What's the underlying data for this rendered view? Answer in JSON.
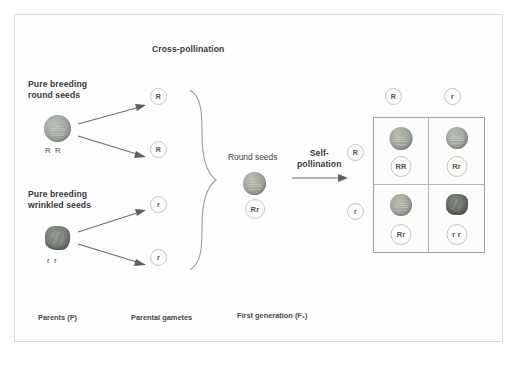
{
  "figure": {
    "title_top": "Cross-pollination",
    "self_pollination": "Self-\npollination"
  },
  "parents": {
    "round": {
      "heading": "Pure breeding\nround seeds",
      "genotype": "R R",
      "seed_type": "round-seed"
    },
    "wrinkled": {
      "heading": "Pure breeding\nwrinkled seeds",
      "genotype": "r r",
      "seed_type": "wrinkled-seed"
    }
  },
  "gametes": {
    "round_parent": [
      "R",
      "R"
    ],
    "wrinkled_parent": [
      "r",
      "r"
    ]
  },
  "f1": {
    "label": "Round seeds",
    "genotype": "Rr"
  },
  "punnett": {
    "column_headers": [
      "R",
      "r"
    ],
    "row_headers": [
      "R",
      "r"
    ],
    "cells": [
      {
        "genotype": "RR",
        "seed": "round-seed"
      },
      {
        "genotype": "Rr",
        "seed": "round-seed"
      },
      {
        "genotype": "Rr",
        "seed": "round-seed"
      },
      {
        "genotype": "r r",
        "seed": "wrinkled-seed"
      }
    ]
  },
  "stage_captions": {
    "parents": "Parents (P)",
    "gametes": "Parental gametes",
    "first_generation": "First generation (F₁)"
  },
  "colors": {
    "frame_border": "#d8d8d8",
    "round_seed": "#a3a89d",
    "wrinkled_seed": "#787d73",
    "bubble_border": "#c3c6c0",
    "arrow": "#6b6f68",
    "punnett_border": "#9ba09a",
    "text": "#3d3d3d"
  }
}
